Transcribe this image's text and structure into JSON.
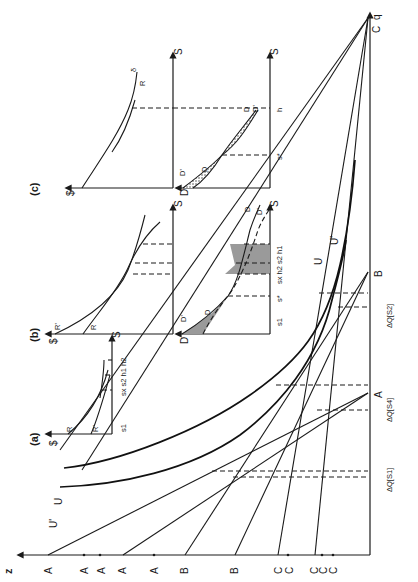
{
  "figure": {
    "orientation": "rotated 90 degrees counter-clockwise",
    "main_panel": {
      "vertical_axis_label": "z",
      "horizontal_axis_label": "q",
      "origin_label": "C",
      "z_axis_ticks": [
        "A1",
        "A2",
        "A5",
        "A3",
        "A4",
        "B1",
        "B2",
        "C1",
        "C4",
        "C3",
        "C5",
        "C2"
      ],
      "curve_labels": [
        "U",
        "U'"
      ],
      "q_axis_points": [
        "A",
        "B"
      ],
      "interval_labels": [
        "ΔQ[S1]",
        "ΔQ[S4]",
        "ΔQ[S2]"
      ]
    },
    "panel_a": {
      "title": "(a)",
      "y_axis": "$",
      "x_axis": "S",
      "curves": [
        "R",
        "R'",
        "δ"
      ],
      "x_ticks": [
        "s1",
        "sx s2 h1 h2"
      ]
    },
    "panel_b_top": {
      "title": "(b)",
      "y_axis": "$",
      "x_axis": "S",
      "curves": [
        "R",
        "R'",
        "δ"
      ]
    },
    "panel_b_bottom": {
      "y_axis": "D",
      "x_axis": "S",
      "curves": [
        "D",
        "D'"
      ],
      "x_ticks": [
        "s1",
        "s*",
        "sx h2 s2 h1"
      ]
    },
    "panel_c_top": {
      "title": "(c)",
      "y_axis": "$",
      "x_axis": "S",
      "curves": [
        "R",
        "δ"
      ]
    },
    "panel_c_bottom": {
      "y_axis": "D",
      "x_axis": "S",
      "curves": [
        "D",
        "D'"
      ],
      "x_ticks": [
        "s*",
        "h"
      ]
    }
  },
  "labels": {
    "z": "z",
    "q": "q",
    "C_origin": "C",
    "A1": "A",
    "A1s": "1",
    "A2": "A",
    "A2s": "2",
    "A5": "A",
    "A5s": "5",
    "A3": "A",
    "A3s": "3",
    "A4": "A",
    "A4s": "4",
    "B1": "B",
    "B1s": "1",
    "B2": "B",
    "B2s": "2",
    "C1": "C",
    "C1s": "1",
    "C4": "C",
    "C4s": "4",
    "C3": "C",
    "C3s": "3",
    "C5": "C",
    "C5s": "5",
    "C2": "C",
    "C2s": "2",
    "U": "U",
    "Uprime": "U'",
    "U_lower": "U",
    "Uprime_lower": "U'",
    "A_pt": "A",
    "B_pt": "B",
    "dQ1": "ΔQ[S1]",
    "dQ4": "ΔQ[S4]",
    "dQ2": "ΔQ[S2]",
    "a_title": "(a)",
    "b_title": "(b)",
    "c_title": "(c)",
    "dollar": "$",
    "S": "S",
    "R": "R",
    "Rprime": "R'",
    "delta": "δ",
    "D": "D",
    "Dprime": "D'",
    "s1": "s1",
    "sstar": "s*",
    "a_ticks": "sx s2 h1 h2",
    "b_ticks": "sx h2 s2 h1",
    "h": "h"
  }
}
